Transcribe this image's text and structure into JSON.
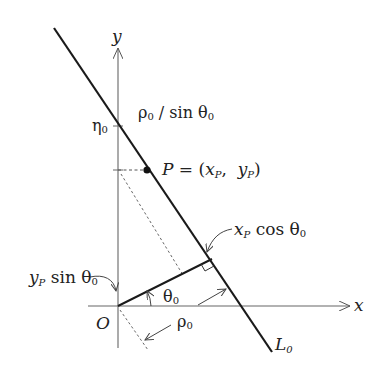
{
  "diagram": {
    "axes": {
      "x_label": "x",
      "y_label": "y",
      "origin_label": "O"
    },
    "line_label": {
      "main": "L",
      "sub": "0"
    },
    "intercept_label": {
      "main": "η",
      "sub": "0"
    },
    "intercept_expr": {
      "a": "ρ",
      "a_sub": "0",
      "rest": " / sin θ",
      "rest_sub": "0"
    },
    "point_label": {
      "p": "P",
      "eq": " = (",
      "x": "x",
      "x_sub": "P",
      "comma": ",  ",
      "y": "y",
      "y_sub": "P",
      "close": ")"
    },
    "proj_x": {
      "v": "x",
      "v_sub": "P",
      "fn": " cos θ",
      "fn_sub": "0"
    },
    "proj_y": {
      "v": "y",
      "v_sub": "P",
      "fn": " sin θ",
      "fn_sub": "0"
    },
    "angle_label": {
      "main": "θ",
      "sub": "0"
    },
    "distance_label": {
      "main": "ρ",
      "sub": "0"
    },
    "colors": {
      "line": "#1a1a1a",
      "axis": "#555555",
      "text": "#222222"
    }
  }
}
